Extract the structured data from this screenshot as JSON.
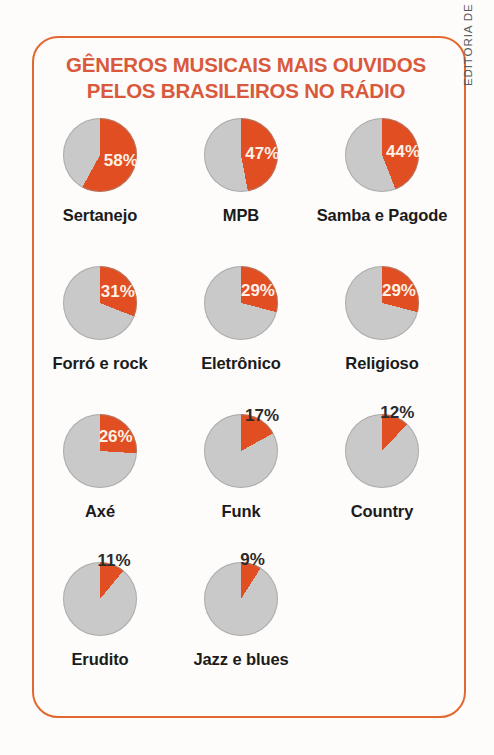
{
  "title": {
    "line1": "GÊNEROS MUSICAIS MAIS OUVIDOS",
    "line2": "PELOS BRASILEIROS NO RÁDIO"
  },
  "credit": "EDITORIA DE ARTE",
  "colors": {
    "slice": "#E04E21",
    "rest": "#c9c9c9",
    "frame": "#E2682F",
    "title": "#D9593C",
    "label": "#1b1b1b",
    "value_inside": "#fdf0e6",
    "value_outside": "#2b2b2b"
  },
  "chart_data": {
    "type": "pie",
    "title": "GÊNEROS MUSICAIS MAIS OUVIDOS PELOS BRASILEIROS NO RÁDIO",
    "xlabel": "",
    "ylabel": "",
    "legend": [],
    "unit": "%",
    "note": "Small multiples: each pie shows the share of listeners for one genre; slice starts at 12 o'clock clockwise.",
    "categories": [
      "Sertanejo",
      "MPB",
      "Samba e Pagode",
      "Forró e rock",
      "Eletrônico",
      "Religioso",
      "Axé",
      "Funk",
      "Country",
      "Erudito",
      "Jazz e blues"
    ],
    "values": [
      58,
      47,
      44,
      31,
      29,
      29,
      26,
      17,
      12,
      11,
      9
    ],
    "items": [
      {
        "label": "Sertanejo",
        "value": 58,
        "display": "58%",
        "label_placement": "inside"
      },
      {
        "label": "MPB",
        "value": 47,
        "display": "47%",
        "label_placement": "inside"
      },
      {
        "label": "Samba e Pagode",
        "value": 44,
        "display": "44%",
        "label_placement": "inside"
      },
      {
        "label": "Forró e rock",
        "value": 31,
        "display": "31%",
        "label_placement": "inside"
      },
      {
        "label": "Eletrônico",
        "value": 29,
        "display": "29%",
        "label_placement": "inside"
      },
      {
        "label": "Religioso",
        "value": 29,
        "display": "29%",
        "label_placement": "inside"
      },
      {
        "label": "Axé",
        "value": 26,
        "display": "26%",
        "label_placement": "inside"
      },
      {
        "label": "Funk",
        "value": 17,
        "display": "17%",
        "label_placement": "outside"
      },
      {
        "label": "Country",
        "value": 12,
        "display": "12%",
        "label_placement": "outside"
      },
      {
        "label": "Erudito",
        "value": 11,
        "display": "11%",
        "label_placement": "outside"
      },
      {
        "label": "Jazz e blues",
        "value": 9,
        "display": "9%",
        "label_placement": "outside"
      }
    ]
  }
}
